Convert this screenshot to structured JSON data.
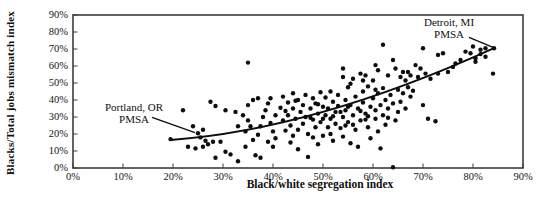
{
  "figure": {
    "width": 546,
    "height": 205,
    "background_color": "#ffffff",
    "ink_color": "#0d0d0d",
    "frame_color": "#3c3c3c"
  },
  "chart_data": {
    "type": "scatter",
    "title": "",
    "xlabel": "Black/white segregation index",
    "ylabel": "Blacks/Total jobs mismatch index",
    "xlim": [
      0,
      90
    ],
    "ylim": [
      0,
      90
    ],
    "grid": false,
    "legend": null,
    "x_tick_values": [
      0,
      10,
      20,
      30,
      40,
      50,
      60,
      70,
      80,
      90
    ],
    "x_tick_labels": [
      "0%",
      "10%",
      "20%",
      "30%",
      "40%",
      "50%",
      "60%",
      "70%",
      "80%",
      "90%"
    ],
    "y_tick_values": [
      0,
      10,
      20,
      30,
      40,
      50,
      60,
      70,
      80,
      90
    ],
    "y_tick_labels": [
      "0%",
      "10%",
      "20%",
      "30%",
      "40%",
      "50%",
      "60%",
      "70%",
      "80%",
      "90%"
    ],
    "trend_line": {
      "start": [
        19.5,
        16.5
      ],
      "mid": [
        50,
        33
      ],
      "end": [
        84.2,
        70.5
      ]
    },
    "annotations": [
      {
        "id": "detroit",
        "lines": [
          "Detroit, MI",
          "PMSA"
        ],
        "target_point": [
          84.2,
          70.5
        ],
        "text_pos": [
          75.2,
          89.2
        ],
        "pointer": [
          [
            79.2,
            76.8
          ],
          [
            84.0,
            71.0
          ]
        ]
      },
      {
        "id": "portland",
        "lines": [
          "Portland, OR",
          "PMSA"
        ],
        "target_point": [
          24.6,
          20.5
        ],
        "text_pos": [
          12.2,
          39.7
        ],
        "pointer": [
          [
            15.8,
            29.8
          ],
          [
            24.4,
            20.8
          ]
        ]
      }
    ],
    "points": [
      [
        19.5,
        17
      ],
      [
        22,
        34
      ],
      [
        23,
        12.5
      ],
      [
        24,
        24.5
      ],
      [
        24.5,
        11.5
      ],
      [
        25,
        20.5
      ],
      [
        25.5,
        18
      ],
      [
        26,
        22.5
      ],
      [
        26,
        12.5
      ],
      [
        26.5,
        16
      ],
      [
        27,
        14
      ],
      [
        27.5,
        39
      ],
      [
        28,
        15.5
      ],
      [
        28.5,
        36.5
      ],
      [
        28.5,
        6
      ],
      [
        29.5,
        15.5
      ],
      [
        30.5,
        34
      ],
      [
        30.5,
        9.5
      ],
      [
        31.5,
        8
      ],
      [
        32.5,
        33
      ],
      [
        33,
        24.5
      ],
      [
        33,
        4
      ],
      [
        34,
        31
      ],
      [
        34.5,
        21.5
      ],
      [
        34.5,
        12.5
      ],
      [
        35,
        62
      ],
      [
        35,
        37
      ],
      [
        35,
        28
      ],
      [
        35.5,
        24.5
      ],
      [
        36,
        40
      ],
      [
        36,
        16.5
      ],
      [
        36.5,
        7.5
      ],
      [
        37,
        41
      ],
      [
        37,
        19.5
      ],
      [
        37.5,
        24.5
      ],
      [
        37.5,
        6
      ],
      [
        38,
        30
      ],
      [
        38.5,
        34
      ],
      [
        39,
        38
      ],
      [
        39,
        15.5
      ],
      [
        39.5,
        41
      ],
      [
        39.5,
        26.5
      ],
      [
        40,
        21.5
      ],
      [
        40,
        12.5
      ],
      [
        40.5,
        31
      ],
      [
        40.5,
        17.5
      ],
      [
        41.5,
        35.5
      ],
      [
        42,
        42
      ],
      [
        42,
        28
      ],
      [
        42.5,
        33.5
      ],
      [
        42.5,
        22
      ],
      [
        43,
        38.5
      ],
      [
        43,
        31
      ],
      [
        43.5,
        25
      ],
      [
        43.5,
        15
      ],
      [
        44,
        44
      ],
      [
        44,
        35
      ],
      [
        44,
        19
      ],
      [
        44.5,
        29
      ],
      [
        44.5,
        39.5
      ],
      [
        45,
        40
      ],
      [
        45,
        22.5
      ],
      [
        45,
        11
      ],
      [
        45.5,
        33
      ],
      [
        46,
        37
      ],
      [
        46,
        26
      ],
      [
        46.5,
        43
      ],
      [
        46.5,
        30
      ],
      [
        47,
        20
      ],
      [
        47,
        6.5
      ],
      [
        47.5,
        35
      ],
      [
        47.5,
        29.5
      ],
      [
        48,
        41
      ],
      [
        48,
        28.5
      ],
      [
        48,
        18
      ],
      [
        48.5,
        38
      ],
      [
        48.5,
        24
      ],
      [
        49,
        37.5
      ],
      [
        49,
        32
      ],
      [
        49,
        14
      ],
      [
        49.5,
        44.5
      ],
      [
        49.5,
        27
      ],
      [
        50,
        36
      ],
      [
        50,
        29
      ],
      [
        50,
        19
      ],
      [
        50.5,
        41.5
      ],
      [
        50.5,
        31
      ],
      [
        51,
        35
      ],
      [
        51,
        24
      ],
      [
        51.5,
        45
      ],
      [
        51.5,
        29
      ],
      [
        51.5,
        20
      ],
      [
        52,
        39
      ],
      [
        52,
        30.5
      ],
      [
        52,
        16
      ],
      [
        52.5,
        33
      ],
      [
        52.5,
        26
      ],
      [
        53,
        43
      ],
      [
        53,
        36.5
      ],
      [
        53.5,
        33
      ],
      [
        53.5,
        23.5
      ],
      [
        54,
        58.5
      ],
      [
        54,
        53.5
      ],
      [
        54,
        30
      ],
      [
        54,
        18.5
      ],
      [
        54.5,
        40
      ],
      [
        54.5,
        34
      ],
      [
        54.5,
        25
      ],
      [
        55,
        47.5
      ],
      [
        55,
        36
      ],
      [
        55,
        27
      ],
      [
        55.5,
        49.5
      ],
      [
        55.5,
        37
      ],
      [
        55.5,
        14.5
      ],
      [
        56,
        52.5
      ],
      [
        56,
        31
      ],
      [
        56,
        25.5
      ],
      [
        56.5,
        42
      ],
      [
        56.5,
        22.5
      ],
      [
        57,
        35
      ],
      [
        57,
        12.5
      ],
      [
        57.5,
        55.5
      ],
      [
        57.5,
        33.5
      ],
      [
        57.5,
        28
      ],
      [
        58,
        51.5
      ],
      [
        58,
        45
      ],
      [
        58,
        38.5
      ],
      [
        58.5,
        54.5
      ],
      [
        58.5,
        32
      ],
      [
        58.5,
        28.5
      ],
      [
        59,
        48
      ],
      [
        59,
        30.5
      ],
      [
        59,
        24
      ],
      [
        59.5,
        36
      ],
      [
        59.5,
        17.5
      ],
      [
        60,
        51.5
      ],
      [
        60,
        41
      ],
      [
        60.5,
        60.5
      ],
      [
        60.5,
        46
      ],
      [
        60.5,
        34
      ],
      [
        60.5,
        29
      ],
      [
        61,
        57.5
      ],
      [
        61,
        44
      ],
      [
        61,
        21.5
      ],
      [
        61.5,
        37
      ],
      [
        61.5,
        11.5
      ],
      [
        62,
        72.5
      ],
      [
        62,
        47
      ],
      [
        62,
        31
      ],
      [
        62.5,
        40
      ],
      [
        62.5,
        25.5
      ],
      [
        63,
        54.5
      ],
      [
        63,
        35
      ],
      [
        63,
        29.5
      ],
      [
        63.5,
        43
      ],
      [
        64,
        63.5
      ],
      [
        64,
        38
      ],
      [
        64,
        0.5
      ],
      [
        64.5,
        58.5
      ],
      [
        64.5,
        28
      ],
      [
        65,
        46
      ],
      [
        65,
        33
      ],
      [
        65.5,
        53.5
      ],
      [
        65.5,
        39
      ],
      [
        66,
        56.5
      ],
      [
        66,
        44
      ],
      [
        66.5,
        51.5
      ],
      [
        66.5,
        35
      ],
      [
        67,
        56.5
      ],
      [
        67,
        47.5
      ],
      [
        67.5,
        54.5
      ],
      [
        67.5,
        42
      ],
      [
        68,
        45.5
      ],
      [
        68.5,
        60.5
      ],
      [
        69,
        53.5
      ],
      [
        69.5,
        58.5
      ],
      [
        70,
        70.5
      ],
      [
        70,
        37
      ],
      [
        70.5,
        55.5
      ],
      [
        71,
        29
      ],
      [
        71.5,
        52.5
      ],
      [
        72.5,
        27.5
      ],
      [
        73,
        66.5
      ],
      [
        73,
        55.5
      ],
      [
        74,
        67.5
      ],
      [
        75,
        56.5
      ],
      [
        76,
        59.5
      ],
      [
        76.5,
        61.5
      ],
      [
        77.5,
        63.5
      ],
      [
        78.5,
        68.5
      ],
      [
        79.5,
        67.5
      ],
      [
        80,
        71.5
      ],
      [
        80.5,
        64.5
      ],
      [
        80.5,
        62.5
      ],
      [
        81.5,
        69.5
      ],
      [
        81.5,
        67
      ],
      [
        82.5,
        70.5
      ],
      [
        82.5,
        65.5
      ],
      [
        84,
        55.5
      ],
      [
        84.2,
        70.5
      ]
    ]
  },
  "plot_geometry": {
    "left": 73,
    "top": 15,
    "width": 450,
    "height": 153,
    "tick_length": 4.5,
    "dot_radius": 2.2
  }
}
